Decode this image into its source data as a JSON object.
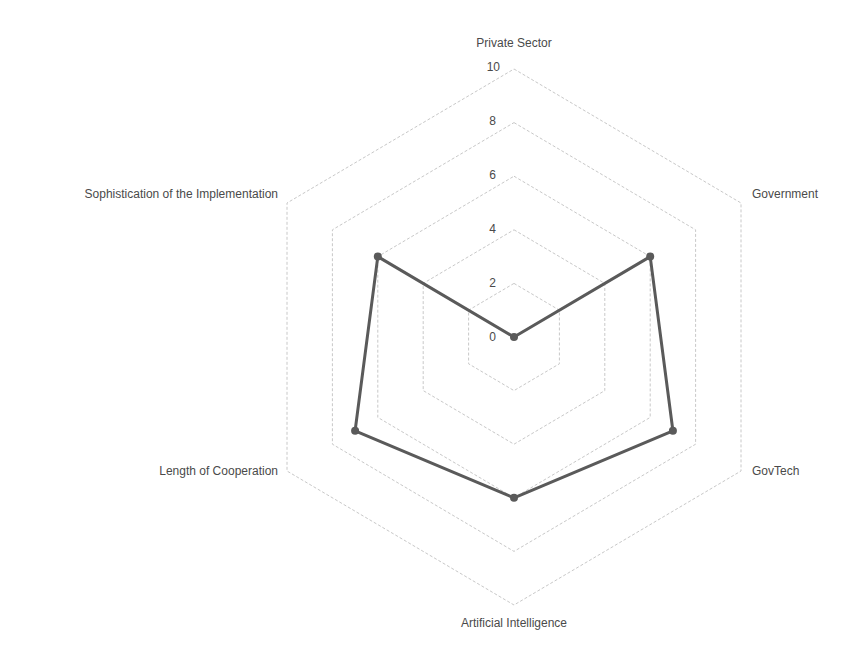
{
  "chart_data": {
    "type": "radar",
    "title": "",
    "categories": [
      "Private Sector",
      "Government",
      "GovTech",
      "Artificial Intelligence",
      "Length of Cooperation",
      "Sophistication of the Implementation"
    ],
    "series": [
      {
        "name": "Series 1",
        "values": [
          0,
          6,
          7,
          6,
          7,
          6
        ],
        "color": "#5a5a5a"
      }
    ],
    "rlim": [
      0,
      10
    ],
    "ticks": [
      "0",
      "2",
      "4",
      "6",
      "8",
      "10"
    ],
    "grid": true,
    "legend": "none"
  },
  "labels": {
    "axis_0": "Private Sector",
    "axis_1": "Government",
    "axis_2": "GovTech",
    "axis_3": "Artificial Intelligence",
    "axis_4": "Length of Cooperation",
    "axis_5": "Sophistication of the Implementation",
    "tick_0": "0",
    "tick_2": "2",
    "tick_4": "4",
    "tick_6": "6",
    "tick_8": "8",
    "tick_10": "10"
  }
}
